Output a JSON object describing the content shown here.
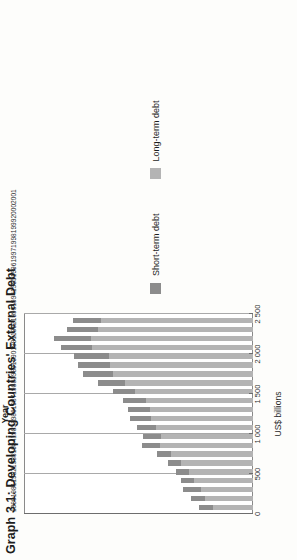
{
  "figure": {
    "title": "Graph 3.1: Developing Countries' External Debt"
  },
  "axes": {
    "value_axis_title": "US$ billions",
    "category_axis_title": "Year"
  },
  "legend": {
    "items": [
      {
        "label": "Short-term debt",
        "color": "#8c8c8c"
      },
      {
        "label": "Long-term debt",
        "color": "#b4b4b4"
      }
    ]
  },
  "colors": {
    "short_term": "#8c8c8c",
    "long_term": "#b4b4b4",
    "gridline": "#a9a9a9",
    "frame": "#8a8a8a",
    "plot_background": "#ffffff",
    "page_background": "#fdfdfb"
  },
  "chart_data": {
    "type": "bar",
    "title": "Graph 3.1: Developing Countries' External Debt",
    "subtitle": "",
    "xlabel": "Year",
    "ylabel": "US$ billions",
    "orientation": "horizontal-bars-rotated-page",
    "stacked": true,
    "grid": true,
    "legend_position": "bottom-right",
    "ylim": [
      0,
      2500
    ],
    "yticks": [
      0,
      500,
      1000,
      1500,
      2000,
      2500
    ],
    "ytick_labels": [
      "0",
      "500",
      "1 000",
      "1 500",
      "2 000",
      "2 500"
    ],
    "categories": [
      "1980",
      "1981",
      "1982",
      "1983",
      "1984",
      "1985",
      "1986",
      "1987",
      "1988",
      "1989",
      "1990",
      "1991",
      "1992",
      "1993",
      "1994",
      "1995",
      "1996",
      "1997",
      "1998",
      "1999",
      "2000",
      "2001"
    ],
    "series": [
      {
        "name": "Long-term debt",
        "color": "#b4b4b4",
        "values": [
          440,
          520,
          570,
          640,
          700,
          790,
          900,
          1020,
          1000,
          1060,
          1110,
          1130,
          1170,
          1290,
          1400,
          1530,
          1560,
          1570,
          1760,
          1770,
          1690,
          1660
        ]
      },
      {
        "name": "Short-term debt",
        "color": "#8c8c8c",
        "values": [
          150,
          160,
          190,
          150,
          140,
          140,
          150,
          190,
          200,
          210,
          230,
          230,
          250,
          240,
          290,
          330,
          350,
          380,
          340,
          400,
          340,
          310
        ]
      }
    ],
    "totals": [
      590,
      680,
      760,
      790,
      840,
      930,
      1050,
      1210,
      1200,
      1270,
      1340,
      1360,
      1420,
      1530,
      1690,
      1860,
      1910,
      1950,
      2100,
      2170,
      2030,
      1970
    ]
  }
}
